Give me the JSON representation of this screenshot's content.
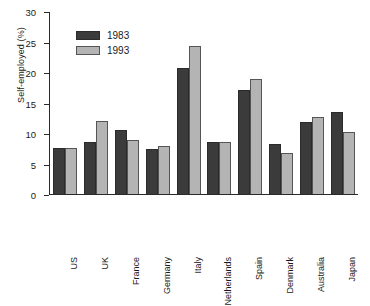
{
  "chart_data": {
    "type": "bar",
    "title": "",
    "subtitle": "",
    "xlabel": "",
    "ylabel": "Self-employed (%)",
    "ylim": [
      0,
      30
    ],
    "yticks": [
      0,
      5,
      10,
      15,
      20,
      25,
      30
    ],
    "ytick_labels": [
      "0",
      "5",
      "10",
      "15",
      "20",
      "25",
      "30"
    ],
    "grid": false,
    "legend_position": "top-left-inside",
    "categories": [
      "US",
      "UK",
      "France",
      "Germany",
      "Italy",
      "Netherlands",
      "Spain",
      "Denmark",
      "Australia",
      "Japan"
    ],
    "series": [
      {
        "name": "1983",
        "color": "#3b3b3b",
        "values": [
          7.6,
          8.6,
          10.5,
          7.4,
          20.7,
          8.5,
          17.0,
          8.2,
          11.8,
          13.4
        ]
      },
      {
        "name": "1993",
        "color": "#b4b4b4",
        "values": [
          7.6,
          11.9,
          8.8,
          7.9,
          24.3,
          8.6,
          18.8,
          6.8,
          12.6,
          10.2
        ]
      }
    ],
    "annotations": []
  },
  "legend": {
    "items": [
      {
        "label": "1983"
      },
      {
        "label": "1993"
      }
    ]
  },
  "colors": {
    "series_1983": "#3b3b3b",
    "series_1993": "#b4b4b4",
    "axis": "#2a2a2a",
    "background": "#ffffff"
  }
}
